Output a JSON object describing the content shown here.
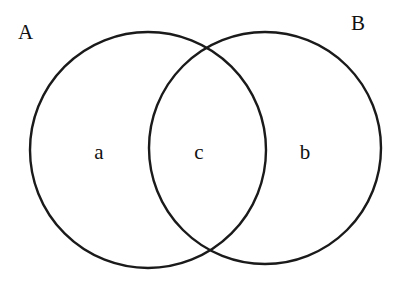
{
  "diagram": {
    "type": "venn",
    "sets": [
      {
        "id": "A",
        "label": "A",
        "cx": 148,
        "cy": 150,
        "r": 118
      },
      {
        "id": "B",
        "label": "B",
        "cx": 265,
        "cy": 148,
        "r": 116
      }
    ],
    "regions": [
      {
        "id": "a",
        "label": "a",
        "description": "only in A"
      },
      {
        "id": "c",
        "label": "c",
        "description": "intersection of A and B"
      },
      {
        "id": "b",
        "label": "b",
        "description": "only in B"
      }
    ],
    "colors": {
      "stroke": "#1a1a1a",
      "text": "#111111",
      "background": "#ffffff"
    }
  }
}
